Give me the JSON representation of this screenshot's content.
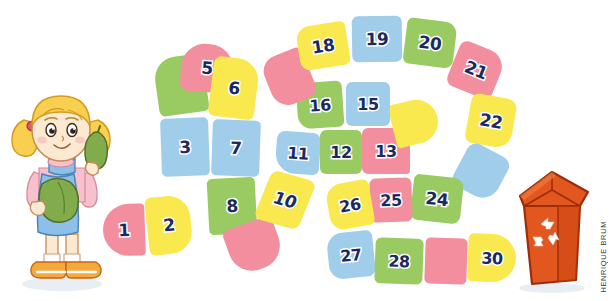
{
  "illustration": {
    "title": "Board game path with recycling theme",
    "credit": "HENRIQUE BRUM",
    "palette": {
      "pink": "#f28e9e",
      "yellow": "#fae84f",
      "blue": "#9fcdea",
      "green": "#9acb62",
      "number_fill": "#1b2a5e",
      "number_outline": "#ffffff",
      "bin_body": "#e2561f",
      "bin_outline": "#9c2d0a",
      "background": "#ffffff"
    }
  },
  "board": {
    "name": "numbered-game-path",
    "total_tiles": 30,
    "tiles": [
      {
        "n": 1,
        "label": "1",
        "color": "pink"
      },
      {
        "n": 2,
        "label": "2",
        "color": "yellow"
      },
      {
        "n": 3,
        "label": "3",
        "color": "blue"
      },
      {
        "n": 4,
        "label": "",
        "color": "green"
      },
      {
        "n": 5,
        "label": "5",
        "color": "pink"
      },
      {
        "n": 6,
        "label": "6",
        "color": "yellow"
      },
      {
        "n": 7,
        "label": "7",
        "color": "blue"
      },
      {
        "n": 8,
        "label": "8",
        "color": "green"
      },
      {
        "n": 9,
        "label": "",
        "color": "pink"
      },
      {
        "n": 10,
        "label": "10",
        "color": "yellow"
      },
      {
        "n": 11,
        "label": "11",
        "color": "blue"
      },
      {
        "n": 12,
        "label": "12",
        "color": "green"
      },
      {
        "n": 13,
        "label": "13",
        "color": "pink"
      },
      {
        "n": 14,
        "label": "",
        "color": "yellow"
      },
      {
        "n": 15,
        "label": "15",
        "color": "blue"
      },
      {
        "n": 16,
        "label": "16",
        "color": "green"
      },
      {
        "n": 17,
        "label": "",
        "color": "pink"
      },
      {
        "n": 18,
        "label": "18",
        "color": "yellow"
      },
      {
        "n": 19,
        "label": "19",
        "color": "blue"
      },
      {
        "n": 20,
        "label": "20",
        "color": "green"
      },
      {
        "n": 21,
        "label": "21",
        "color": "pink"
      },
      {
        "n": 22,
        "label": "22",
        "color": "yellow"
      },
      {
        "n": 23,
        "label": "",
        "color": "blue"
      },
      {
        "n": 24,
        "label": "24",
        "color": "green"
      },
      {
        "n": 25,
        "label": "25",
        "color": "pink"
      },
      {
        "n": 26,
        "label": "26",
        "color": "yellow"
      },
      {
        "n": 27,
        "label": "27",
        "color": "blue"
      },
      {
        "n": 28,
        "label": "28",
        "color": "green"
      },
      {
        "n": 29,
        "label": "",
        "color": "pink"
      },
      {
        "n": 30,
        "label": "30",
        "color": "yellow"
      }
    ]
  },
  "characters": {
    "girl": {
      "name": "girl-holding-vegetables",
      "hair_color": "#f8cf4e",
      "dress_color": "#8cc0ea",
      "shirt_color": "#f6c0cd",
      "shoe_color": "#f4a93c",
      "vegetable_color": "#82ab4b"
    },
    "bin": {
      "name": "recycling-bin",
      "symbol": "recycling-arrows"
    }
  }
}
